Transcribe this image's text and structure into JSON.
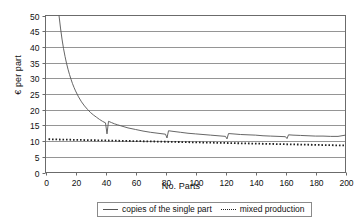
{
  "chart_data": {
    "type": "line",
    "title": "",
    "xlabel": "No. Parts",
    "ylabel": "€ per part",
    "xlim": [
      0,
      200
    ],
    "ylim": [
      0,
      50
    ],
    "xticks": [
      0,
      20,
      40,
      60,
      80,
      100,
      120,
      140,
      160,
      180,
      200
    ],
    "yticks": [
      0,
      5,
      10,
      15,
      20,
      25,
      30,
      35,
      40,
      45,
      50
    ],
    "grid": "horizontal",
    "legend_position": "bottom",
    "series": [
      {
        "name": "copies of the single part",
        "style": "solid",
        "color": "#555555",
        "note": "hyperbolic decay with sawtooth jumps at batch boundaries every 40 parts",
        "points": [
          [
            9,
            50.0
          ],
          [
            10,
            46.0
          ],
          [
            11,
            42.5
          ],
          [
            12,
            39.5
          ],
          [
            13,
            37.0
          ],
          [
            14,
            34.8
          ],
          [
            15,
            32.9
          ],
          [
            16,
            31.2
          ],
          [
            17,
            29.7
          ],
          [
            18,
            28.3
          ],
          [
            19,
            27.1
          ],
          [
            20,
            26.0
          ],
          [
            22,
            24.1
          ],
          [
            24,
            22.5
          ],
          [
            26,
            21.2
          ],
          [
            28,
            20.1
          ],
          [
            30,
            19.1
          ],
          [
            32,
            18.3
          ],
          [
            34,
            17.6
          ],
          [
            36,
            16.9
          ],
          [
            38,
            16.3
          ],
          [
            40,
            15.8
          ],
          [
            41,
            12.3
          ],
          [
            42,
            16.3
          ],
          [
            44,
            15.9
          ],
          [
            46,
            15.5
          ],
          [
            48,
            15.2
          ],
          [
            50,
            14.9
          ],
          [
            55,
            14.2
          ],
          [
            60,
            13.7
          ],
          [
            65,
            13.2
          ],
          [
            70,
            12.8
          ],
          [
            75,
            12.5
          ],
          [
            80,
            12.2
          ],
          [
            81,
            11.0
          ],
          [
            82,
            13.3
          ],
          [
            85,
            13.1
          ],
          [
            90,
            12.8
          ],
          [
            95,
            12.5
          ],
          [
            100,
            12.3
          ],
          [
            105,
            12.1
          ],
          [
            110,
            11.9
          ],
          [
            115,
            11.7
          ],
          [
            120,
            11.5
          ],
          [
            121,
            10.7
          ],
          [
            122,
            12.4
          ],
          [
            125,
            12.3
          ],
          [
            130,
            12.1
          ],
          [
            135,
            12.0
          ],
          [
            140,
            11.9
          ],
          [
            145,
            11.7
          ],
          [
            150,
            11.6
          ],
          [
            155,
            11.5
          ],
          [
            160,
            11.4
          ],
          [
            161,
            10.8
          ],
          [
            162,
            12.0
          ],
          [
            165,
            11.9
          ],
          [
            170,
            11.8
          ],
          [
            175,
            11.7
          ],
          [
            180,
            11.6
          ],
          [
            185,
            11.6
          ],
          [
            190,
            11.5
          ],
          [
            195,
            11.5
          ],
          [
            200,
            11.9
          ]
        ]
      },
      {
        "name": "mixed production",
        "style": "dotted",
        "color": "#222222",
        "note": "nearly flat, slowly declining from about 10.6 to 8.6",
        "points": [
          [
            2,
            10.6
          ],
          [
            10,
            10.5
          ],
          [
            20,
            10.4
          ],
          [
            30,
            10.3
          ],
          [
            40,
            10.2
          ],
          [
            50,
            10.1
          ],
          [
            60,
            10.0
          ],
          [
            70,
            9.9
          ],
          [
            80,
            9.8
          ],
          [
            90,
            9.7
          ],
          [
            100,
            9.6
          ],
          [
            110,
            9.5
          ],
          [
            120,
            9.4
          ],
          [
            130,
            9.3
          ],
          [
            140,
            9.2
          ],
          [
            150,
            9.1
          ],
          [
            160,
            9.0
          ],
          [
            170,
            8.9
          ],
          [
            180,
            8.8
          ],
          [
            190,
            8.7
          ],
          [
            200,
            8.6
          ]
        ]
      }
    ]
  },
  "legend": {
    "entries": [
      {
        "label": "copies of the single part",
        "marker": "solid-line-swatch"
      },
      {
        "label": "mixed production",
        "marker": "dotted-line-swatch"
      }
    ]
  }
}
